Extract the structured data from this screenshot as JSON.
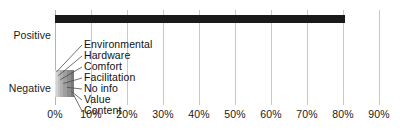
{
  "chart_data": {
    "type": "bar",
    "orientation": "horizontal",
    "stacked": true,
    "title": "",
    "subtitle": "",
    "xlabel": "",
    "ylabel": "",
    "categories": [
      "Positive",
      "Negative"
    ],
    "xlim": [
      0,
      90
    ],
    "xticks": [
      0,
      10,
      20,
      30,
      40,
      50,
      60,
      70,
      80,
      90
    ],
    "xtick_labels": [
      "0%",
      "10%",
      "20%",
      "30%",
      "40%",
      "50%",
      "60%",
      "70%",
      "80%",
      "90%"
    ],
    "grid": true,
    "legend": "none",
    "annotations": [
      "Environmental",
      "Hardware",
      "Comfort",
      "Facilitation",
      "No info",
      "Value",
      "Content"
    ],
    "series": [
      {
        "name": "Positive",
        "values": [
          80.5,
          0
        ],
        "color": "#1a1a1a"
      },
      {
        "name": "Environmental",
        "values": [
          0,
          0.4
        ],
        "color": "#e2e2e2"
      },
      {
        "name": "Hardware",
        "values": [
          0,
          0.5
        ],
        "color": "#d2d2d2"
      },
      {
        "name": "Comfort",
        "values": [
          0,
          0.6
        ],
        "color": "#c2c2c2"
      },
      {
        "name": "Facilitation",
        "values": [
          0,
          0.8
        ],
        "color": "#b0b0b0"
      },
      {
        "name": "No info",
        "values": [
          0,
          1.0
        ],
        "color": "#9e9e9e"
      },
      {
        "name": "Value",
        "values": [
          0,
          1.2
        ],
        "color": "#8c8c8c"
      },
      {
        "name": "Content",
        "values": [
          0,
          0.7
        ],
        "color": "#7a7a7a"
      }
    ]
  },
  "axis": {
    "y_categories": [
      {
        "label": "Positive"
      },
      {
        "label": "Negative"
      }
    ],
    "x_ticks": [
      {
        "label": "0%",
        "value": 0
      },
      {
        "label": "10%",
        "value": 10
      },
      {
        "label": "20%",
        "value": 20
      },
      {
        "label": "30%",
        "value": 30
      },
      {
        "label": "40%",
        "value": 40
      },
      {
        "label": "50%",
        "value": 50
      },
      {
        "label": "60%",
        "value": 60
      },
      {
        "label": "70%",
        "value": 70
      },
      {
        "label": "80%",
        "value": 80
      },
      {
        "label": "90%",
        "value": 90
      }
    ]
  },
  "positive_bar": {
    "total": 80.5,
    "color": "#1a1a1a"
  },
  "negative_stack": {
    "segments": [
      {
        "label": "Environmental",
        "value": 0.4,
        "color": "#e2e2e2"
      },
      {
        "label": "Hardware",
        "value": 0.5,
        "color": "#d2d2d2"
      },
      {
        "label": "Comfort",
        "value": 0.6,
        "color": "#c2c2c2"
      },
      {
        "label": "Facilitation",
        "value": 0.8,
        "color": "#b0b0b0"
      },
      {
        "label": "No info",
        "value": 1.0,
        "color": "#9e9e9e"
      },
      {
        "label": "Value",
        "value": 1.2,
        "color": "#8c8c8c"
      },
      {
        "label": "Content",
        "value": 0.7,
        "color": "#7a7a7a"
      }
    ]
  },
  "callouts": [
    {
      "label": "Environmental",
      "top": 39
    },
    {
      "label": "Hardware",
      "top": 50
    },
    {
      "label": "Comfort",
      "top": 61
    },
    {
      "label": "Facilitation",
      "top": 72
    },
    {
      "label": "No info",
      "top": 83
    },
    {
      "label": "Value",
      "top": 94
    },
    {
      "label": "Content",
      "top": 105
    }
  ],
  "colors": {
    "bar_dark": "#1a1a1a",
    "gridline": "#c9c9c9",
    "text": "#1a1a1a",
    "background": "#ffffff",
    "leader_line": "#4a4a4a"
  }
}
